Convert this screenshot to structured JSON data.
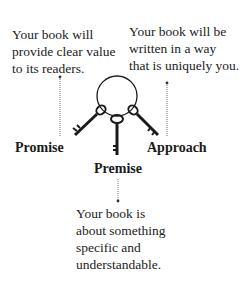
{
  "diagram": {
    "type": "key-ring concept diagram",
    "keys": [
      {
        "label": "Promise",
        "description": "Your book will\nprovide clear value\nto its readers."
      },
      {
        "label": "Premise",
        "description": "Your book is\nabout something\nspecific and\nunderstandable."
      },
      {
        "label": "Approach",
        "description": "Your book will be\nwritten in a way\nthat is uniquely you."
      }
    ],
    "colors": {
      "ink": "#1a1a1a",
      "leader_line": "#555555",
      "background": "#ffffff"
    }
  }
}
